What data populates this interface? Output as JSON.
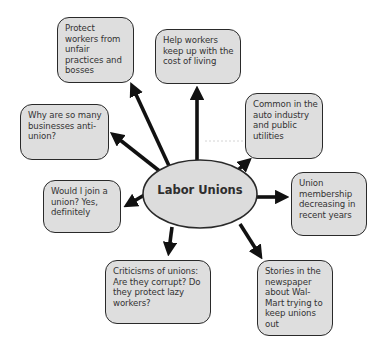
{
  "diagram": {
    "type": "concept-map",
    "center": {
      "label": "Labor Unions",
      "fill": "#dcdcdc",
      "stroke": "#2a2a2a"
    },
    "nodes": [
      {
        "id": "protect",
        "text": "Protect workers from unfair practices and bosses"
      },
      {
        "id": "cost-of-living",
        "text": "Help workers keep up with the cost of living"
      },
      {
        "id": "common-industries",
        "text": "Common in the auto industry and public utilities"
      },
      {
        "id": "membership",
        "text": "Union membership decreasing in recent years"
      },
      {
        "id": "walmart",
        "text": "Stories in the newspaper about Wal-Mart trying to keep unions out"
      },
      {
        "id": "criticisms",
        "text": "Criticisms of unions: Are they corrupt? Do they protect lazy workers?"
      },
      {
        "id": "join",
        "text": "Would I join a union? Yes, definitely"
      },
      {
        "id": "anti-union",
        "text": "Why are so many businesses anti-union?"
      }
    ],
    "colors": {
      "box_fill": "#dedede",
      "border": "#2a2a2a",
      "text": "#333333",
      "arrow": "#111111",
      "background": "#ffffff"
    }
  }
}
